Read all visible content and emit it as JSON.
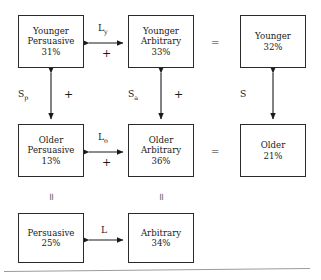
{
  "diagram": {
    "boxes": {
      "younger_persuasive": {
        "line1": "Younger",
        "line2": "Persuasive",
        "value": "31%"
      },
      "younger_arbitrary": {
        "line1": "Younger",
        "line2": "Arbitrary",
        "value": "33%"
      },
      "younger_total": {
        "line1": "Younger",
        "value": "32%"
      },
      "older_persuasive": {
        "line1": "Older",
        "line2": "Persuasive",
        "value": "13%"
      },
      "older_arbitrary": {
        "line1": "Older",
        "line2": "Arbitrary",
        "value": "36%"
      },
      "older_total": {
        "line1": "Older",
        "value": "21%"
      },
      "persuasive_total": {
        "line1": "Persuasive",
        "value": "25%"
      },
      "arbitrary_total": {
        "line1": "Arbitrary",
        "value": "34%"
      }
    },
    "arrow_labels": {
      "ly": {
        "base": "L",
        "sub": "y"
      },
      "lo": {
        "base": "L",
        "sub": "o"
      },
      "l": {
        "base": "L",
        "sub": ""
      },
      "sp": {
        "base": "S",
        "sub": "p"
      },
      "sa": {
        "base": "S",
        "sub": "a"
      },
      "s": {
        "base": "S",
        "sub": ""
      }
    },
    "signs": {
      "ly_sign": "+",
      "lo_sign": "+",
      "sp_sign": "+",
      "sa_sign": "+"
    },
    "equals": {
      "younger_row": "=",
      "older_row": "=",
      "persuasive_col": "=",
      "arbitrary_col": "="
    },
    "colors": {
      "box_border": "#2a2a2a",
      "arrow": "#1a1a1a",
      "text": "#1a1a1a",
      "page": "#ffffff",
      "baseline": "#9a9a9a"
    }
  }
}
